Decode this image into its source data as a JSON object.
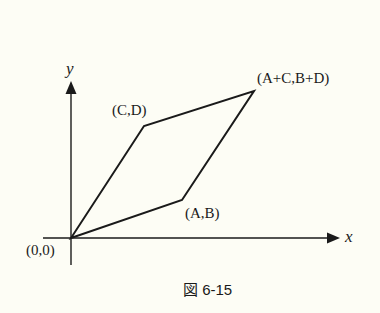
{
  "figure": {
    "caption": "図 6-15",
    "x_axis_label": "x",
    "y_axis_label": "y",
    "points": {
      "origin": {
        "label": "(0,0)"
      },
      "ab": {
        "label": "(A,B)"
      },
      "cd": {
        "label": "(C,D)"
      },
      "sum": {
        "label": "(A+C,B+D)"
      }
    },
    "colors": {
      "background": "#fdfdf5",
      "ink": "#1a1a1a"
    }
  }
}
